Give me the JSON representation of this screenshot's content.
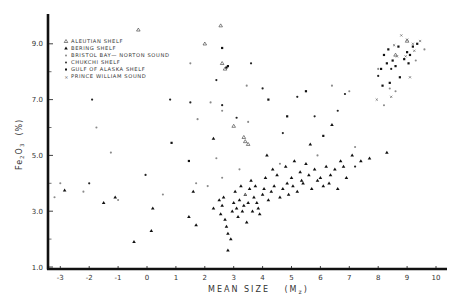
{
  "chart_data": {
    "type": "scatter",
    "title": "",
    "xlabel": "MEAN SIZE (Mz)",
    "xlabel_main": "MEAN SIZE",
    "xlabel_unit": "(M",
    "xlabel_sub": "z",
    "xlabel_close": ")",
    "ylabel": "Fe2O3 (%)",
    "ylabel_parts": {
      "fe": "Fe",
      "sub1": "2",
      "o": "O",
      "sub2": "3",
      "unit": "(%)"
    },
    "xlim": [
      -3.4,
      10.4
    ],
    "ylim": [
      1.0,
      10.0
    ],
    "xticks": [
      -3,
      -2,
      -1,
      0,
      1,
      2,
      3,
      4,
      5,
      6,
      7,
      8,
      9,
      10
    ],
    "xtick_labels": [
      "-3",
      "-2",
      "-1",
      "0",
      "1",
      "2",
      "3",
      "4",
      "5",
      "6",
      "7",
      "8",
      "9",
      "10"
    ],
    "yticks_major": [
      1.0,
      3.0,
      5.0,
      7.0,
      9.0
    ],
    "ytick_labels": [
      "1.0",
      "3.0",
      "5.0",
      "7.0",
      "9.0"
    ],
    "yticks_minor": [
      2.0,
      4.0,
      6.0,
      8.0
    ],
    "grid": false,
    "legend_position": "upper-left",
    "series": [
      {
        "name": "ALEUTIAN SHELF",
        "marker": "open-triangle",
        "points": [
          [
            -0.3,
            9.5
          ],
          [
            2.55,
            9.65
          ],
          [
            2.0,
            9.0
          ],
          [
            2.6,
            8.3
          ],
          [
            2.7,
            8.1
          ],
          [
            3.35,
            5.65
          ],
          [
            3.0,
            6.05
          ],
          [
            3.4,
            5.5
          ],
          [
            3.5,
            5.4
          ],
          [
            8.6,
            8.6
          ],
          [
            9.0,
            9.1
          ]
        ]
      },
      {
        "name": "BERING SHELF",
        "marker": "filled-triangle",
        "points": [
          [
            -2.85,
            3.75
          ],
          [
            -1.5,
            3.3
          ],
          [
            -1.1,
            3.5
          ],
          [
            -0.45,
            1.9
          ],
          [
            0.15,
            2.3
          ],
          [
            1.45,
            2.8
          ],
          [
            1.7,
            2.5
          ],
          [
            2.3,
            3.1
          ],
          [
            2.5,
            3.4
          ],
          [
            2.55,
            2.9
          ],
          [
            2.6,
            3.2
          ],
          [
            2.65,
            3.5
          ],
          [
            2.7,
            2.7
          ],
          [
            2.75,
            2.45
          ],
          [
            2.8,
            2.2
          ],
          [
            2.8,
            1.6
          ],
          [
            2.9,
            2.0
          ],
          [
            2.95,
            3.0
          ],
          [
            3.0,
            3.3
          ],
          [
            3.05,
            3.7
          ],
          [
            3.1,
            3.1
          ],
          [
            3.15,
            2.8
          ],
          [
            3.2,
            3.4
          ],
          [
            3.25,
            3.9
          ],
          [
            3.3,
            3.0
          ],
          [
            3.35,
            3.2
          ],
          [
            3.4,
            3.6
          ],
          [
            3.45,
            2.6
          ],
          [
            3.5,
            3.3
          ],
          [
            3.55,
            3.8
          ],
          [
            3.6,
            4.1
          ],
          [
            3.65,
            3.0
          ],
          [
            3.7,
            3.5
          ],
          [
            3.75,
            3.9
          ],
          [
            3.8,
            3.3
          ],
          [
            3.85,
            3.1
          ],
          [
            3.9,
            2.9
          ],
          [
            4.0,
            3.6
          ],
          [
            4.05,
            3.8
          ],
          [
            4.1,
            4.2
          ],
          [
            4.2,
            3.4
          ],
          [
            4.3,
            3.7
          ],
          [
            4.35,
            4.5
          ],
          [
            4.4,
            3.9
          ],
          [
            4.5,
            4.3
          ],
          [
            4.6,
            3.5
          ],
          [
            4.7,
            3.8
          ],
          [
            4.8,
            4.6
          ],
          [
            4.85,
            4.0
          ],
          [
            4.9,
            3.6
          ],
          [
            5.0,
            4.2
          ],
          [
            5.05,
            3.9
          ],
          [
            5.1,
            4.8
          ],
          [
            5.2,
            3.7
          ],
          [
            5.3,
            4.4
          ],
          [
            5.35,
            4.1
          ],
          [
            5.4,
            4.0
          ],
          [
            5.5,
            4.7
          ],
          [
            5.6,
            4.3
          ],
          [
            5.7,
            3.8
          ],
          [
            5.8,
            4.5
          ],
          [
            5.9,
            4.1
          ],
          [
            6.0,
            4.2
          ],
          [
            6.1,
            3.9
          ],
          [
            6.2,
            4.6
          ],
          [
            6.3,
            4.0
          ],
          [
            6.35,
            4.3
          ],
          [
            6.5,
            4.5
          ],
          [
            6.6,
            3.8
          ],
          [
            6.7,
            4.8
          ],
          [
            6.8,
            4.6
          ],
          [
            6.9,
            4.2
          ],
          [
            7.1,
            5.0
          ],
          [
            7.4,
            4.8
          ],
          [
            7.7,
            4.9
          ],
          [
            8.3,
            5.1
          ],
          [
            2.3,
            5.6
          ],
          [
            1.6,
            3.7
          ],
          [
            0.2,
            3.1
          ],
          [
            5.65,
            5.4
          ],
          [
            4.15,
            5.0
          ],
          [
            6.4,
            6.1
          ]
        ]
      },
      {
        "name": "BRISTOL BAY—NORTON SOUND",
        "marker": "small-star",
        "points": [
          [
            -3.2,
            3.5
          ],
          [
            -3.0,
            4.0
          ],
          [
            -2.2,
            3.7
          ],
          [
            -1.0,
            3.4
          ],
          [
            0.55,
            3.6
          ],
          [
            1.7,
            4.0
          ],
          [
            2.1,
            3.9
          ],
          [
            2.4,
            4.9
          ],
          [
            2.6,
            4.2
          ],
          [
            3.2,
            4.5
          ],
          [
            3.4,
            3.6
          ],
          [
            4.6,
            4.7
          ],
          [
            5.9,
            5.0
          ],
          [
            6.4,
            7.5
          ],
          [
            7.0,
            7.3
          ],
          [
            7.2,
            5.3
          ],
          [
            8.4,
            7.4
          ],
          [
            8.6,
            7.3
          ],
          [
            8.2,
            6.8
          ],
          [
            9.3,
            8.4
          ],
          [
            9.6,
            8.8
          ],
          [
            8.0,
            8.1
          ],
          [
            1.5,
            8.3
          ],
          [
            1.75,
            6.3
          ],
          [
            2.6,
            6.6
          ],
          [
            3.5,
            6.2
          ],
          [
            -1.75,
            6.0
          ],
          [
            -1.25,
            5.1
          ],
          [
            3.45,
            7.5
          ],
          [
            2.2,
            6.9
          ]
        ]
      },
      {
        "name": "CHUKCHI SHELF",
        "marker": "dot",
        "points": [
          [
            -2.0,
            4.0
          ],
          [
            -1.9,
            7.0
          ],
          [
            -0.05,
            4.3
          ],
          [
            0.8,
            7.0
          ],
          [
            2.4,
            7.7
          ],
          [
            2.6,
            6.8
          ],
          [
            3.6,
            8.3
          ],
          [
            4.0,
            7.4
          ],
          [
            4.7,
            5.8
          ],
          [
            5.8,
            6.4
          ],
          [
            6.6,
            6.6
          ],
          [
            6.85,
            7.2
          ],
          [
            8.0,
            7.85
          ],
          [
            8.45,
            8.1
          ],
          [
            7.2,
            4.6
          ],
          [
            1.5,
            6.9
          ],
          [
            5.2,
            7.1
          ],
          [
            3.1,
            6.35
          ]
        ]
      },
      {
        "name": "GULF OF ALASKA SHELF",
        "marker": "filled-square",
        "points": [
          [
            0.85,
            5.45
          ],
          [
            1.45,
            4.8
          ],
          [
            2.6,
            8.85
          ],
          [
            2.75,
            8.15
          ],
          [
            2.8,
            8.2
          ],
          [
            4.2,
            7.0
          ],
          [
            4.85,
            6.4
          ],
          [
            5.5,
            7.3
          ],
          [
            6.1,
            5.7
          ],
          [
            8.1,
            8.1
          ],
          [
            8.2,
            8.6
          ],
          [
            8.3,
            8.3
          ],
          [
            8.5,
            8.4
          ],
          [
            8.6,
            8.2
          ],
          [
            8.7,
            8.9
          ],
          [
            8.75,
            7.8
          ],
          [
            8.9,
            8.45
          ],
          [
            9.0,
            8.7
          ],
          [
            9.1,
            8.6
          ],
          [
            9.2,
            8.9
          ],
          [
            8.4,
            7.6
          ],
          [
            9.35,
            9.0
          ],
          [
            8.35,
            8.8
          ],
          [
            9.05,
            8.3
          ],
          [
            8.15,
            7.5
          ]
        ]
      },
      {
        "name": "PRINCE WILLIAM SOUND",
        "marker": "x-star",
        "points": [
          [
            8.8,
            9.3
          ],
          [
            9.0,
            9.15
          ],
          [
            9.2,
            9.0
          ],
          [
            8.55,
            8.95
          ],
          [
            9.45,
            9.1
          ],
          [
            8.95,
            8.55
          ],
          [
            9.25,
            8.75
          ],
          [
            8.65,
            8.55
          ],
          [
            9.1,
            7.8
          ],
          [
            8.45,
            7.1
          ],
          [
            7.95,
            7.0
          ]
        ]
      }
    ]
  },
  "legend": {
    "items": [
      {
        "label": "ALEUTIAN SHELF",
        "marker": "open-triangle"
      },
      {
        "label": "BERING SHELF",
        "marker": "filled-triangle"
      },
      {
        "label": "BRISTOL BAY— NORTON SOUND",
        "marker": "small-star"
      },
      {
        "label": "CHUKCHI SHELF",
        "marker": "dot"
      },
      {
        "label": "GULF OF ALASKA SHELF",
        "marker": "filled-square"
      },
      {
        "label": "PRINCE WILLIAM SOUND",
        "marker": "x-star"
      }
    ]
  },
  "colors": {
    "ink": "#1a1a1a",
    "light_ink": "#8a8a8a",
    "background": "#ffffff"
  }
}
